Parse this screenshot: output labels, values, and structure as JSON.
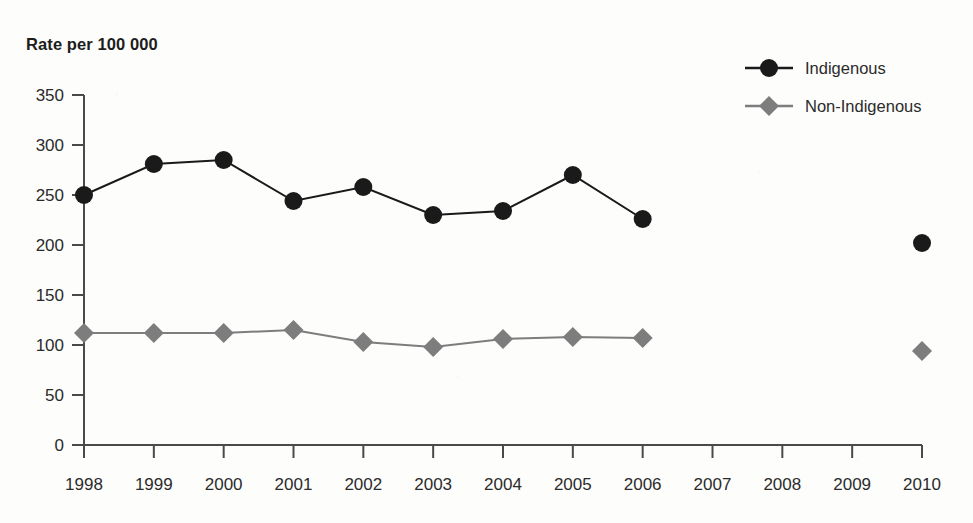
{
  "chart_data": {
    "type": "line",
    "title": "Rate per 100 000",
    "xlabel": "",
    "ylabel": "Rate per 100 000",
    "x": [
      1998,
      1999,
      2000,
      2001,
      2002,
      2003,
      2004,
      2005,
      2006,
      2007,
      2008,
      2009,
      2010
    ],
    "categories": [
      "1998",
      "1999",
      "2000",
      "2001",
      "2002",
      "2003",
      "2004",
      "2005",
      "2006",
      "2007",
      "2008",
      "2009",
      "2010"
    ],
    "ylim": [
      0,
      350
    ],
    "yticks": [
      0,
      50,
      100,
      150,
      200,
      250,
      300,
      350
    ],
    "ytick_labels": [
      "0",
      "50",
      "100",
      "150",
      "200",
      "250",
      "300",
      "350"
    ],
    "grid": false,
    "legend_position": "top-right",
    "series": [
      {
        "name": "Indigenous",
        "color": "#1a1a1a",
        "marker": "circle",
        "values": [
          250,
          281,
          285,
          244,
          258,
          230,
          234,
          270,
          226,
          null,
          null,
          null,
          202
        ]
      },
      {
        "name": "Non-Indigenous",
        "color": "#7d7d7d",
        "marker": "diamond",
        "values": [
          112,
          112,
          112,
          115,
          103,
          98,
          106,
          108,
          107,
          null,
          null,
          null,
          94
        ]
      }
    ]
  },
  "axis": {
    "line_color": "#4a4a4a",
    "tick_color": "#4a4a4a"
  },
  "legend": {
    "items": [
      {
        "label": "Indigenous"
      },
      {
        "label": "Non-Indigenous"
      }
    ]
  }
}
